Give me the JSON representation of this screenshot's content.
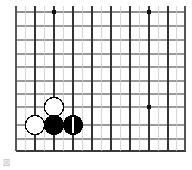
{
  "diagram": {
    "kind": "go-board-diagram",
    "title": "",
    "caption": "図",
    "board": {
      "size": 19,
      "visible_region": "top-right corner section",
      "cols": 13,
      "rows": 11,
      "origin_x": 16,
      "origin_y": 12,
      "cell_w": 13.5,
      "cell_h": 13.9,
      "line_color": "#333333",
      "border_color": "#3a3a3a",
      "light_line_color": "#9a9a9a",
      "background_color": "#ffffff",
      "edges": {
        "left": true,
        "right": true,
        "bottom": true,
        "top": false
      }
    },
    "star_points": [
      {
        "col": 3,
        "row": 0,
        "label": "hoshi-upper-left"
      },
      {
        "col": 10,
        "row": 0,
        "label": "hoshi-upper-right"
      },
      {
        "col": 10,
        "row": 7,
        "label": "hoshi-center-right"
      }
    ],
    "stones": [
      {
        "col": 3,
        "row": 7,
        "color": "white",
        "marker": "",
        "label": "white-stone-a"
      },
      {
        "col": 1.4,
        "row": 8.2,
        "color": "white",
        "marker": "",
        "label": "white-stone-b"
      },
      {
        "col": 2.8,
        "row": 8.2,
        "color": "black",
        "marker": "",
        "label": "black-stone-a"
      },
      {
        "col": 4.2,
        "row": 8.2,
        "color": "black",
        "marker": "1",
        "label": "black-move-one"
      }
    ],
    "legend": {
      "move_number": "1",
      "black_color": "#000000",
      "white_color": "#ffffff",
      "stone_outline": "#000000"
    }
  }
}
